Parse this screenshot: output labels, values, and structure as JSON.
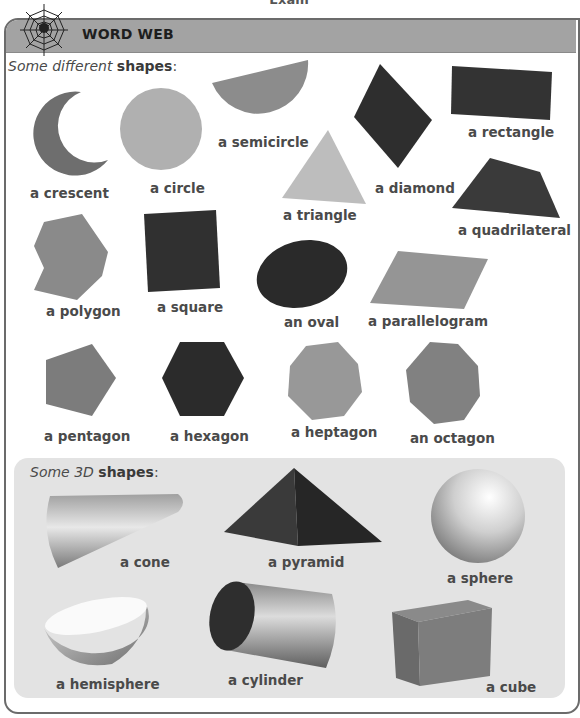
{
  "page": {
    "top_fragment": "Exam",
    "header": {
      "title": "WORD WEB",
      "icon": "spider-web-icon"
    },
    "section_2d": {
      "title_italic": "Some different",
      "title_bold": "shapes",
      "title_suffix": ":",
      "shapes": [
        {
          "label": "a crescent",
          "color": "#6e6e6e"
        },
        {
          "label": "a circle",
          "color": "#b0b0b0"
        },
        {
          "label": "a semicircle",
          "color": "#8c8c8c"
        },
        {
          "label": "a diamond",
          "color": "#2e2e2e"
        },
        {
          "label": "a rectangle",
          "color": "#333333"
        },
        {
          "label": "a triangle",
          "color": "#bdbdbd"
        },
        {
          "label": "a quadrilateral",
          "color": "#3a3a3a"
        },
        {
          "label": "a polygon",
          "color": "#8a8a8a"
        },
        {
          "label": "a square",
          "color": "#303030"
        },
        {
          "label": "an oval",
          "color": "#2a2a2a"
        },
        {
          "label": "a parallelogram",
          "color": "#959595"
        },
        {
          "label": "a pentagon",
          "color": "#7c7c7c"
        },
        {
          "label": "a hexagon",
          "color": "#2b2b2b"
        },
        {
          "label": "a heptagon",
          "color": "#989898"
        },
        {
          "label": "an octagon",
          "color": "#818181"
        }
      ]
    },
    "section_3d": {
      "title_italic": "Some 3D",
      "title_bold": "shapes",
      "title_suffix": ":",
      "shapes": [
        {
          "label": "a cone"
        },
        {
          "label": "a pyramid"
        },
        {
          "label": "a sphere"
        },
        {
          "label": "a hemisphere"
        },
        {
          "label": "a cylinder"
        },
        {
          "label": "a cube"
        }
      ]
    }
  }
}
